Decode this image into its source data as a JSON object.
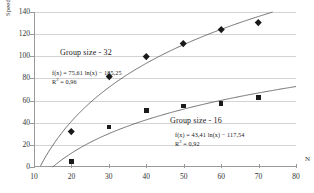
{
  "chart_data": {
    "type": "scatter",
    "title": "",
    "xlabel": "N",
    "ylabel": "Speed-up",
    "xlim": [
      10,
      80
    ],
    "ylim": [
      0,
      140
    ],
    "xticks": [
      10,
      20,
      30,
      40,
      50,
      60,
      70,
      80
    ],
    "yticks": [
      0,
      20,
      40,
      60,
      80,
      100,
      120,
      140
    ],
    "grid": "horizontal",
    "legend": "inline-annotations",
    "series": [
      {
        "name": "Group size - 32",
        "marker": "diamond",
        "x": [
          20,
          30,
          40,
          50,
          60,
          70
        ],
        "values": [
          32,
          82,
          100,
          112,
          124,
          131
        ],
        "trendline": {
          "kind": "logarithmic",
          "equation": "f(x) = 75,61 ln(x) − 185,25",
          "r_squared": "R² = 0,96",
          "a": 75.61,
          "b": -185.25
        }
      },
      {
        "name": "Group size - 16",
        "marker": "square",
        "x": [
          20,
          30,
          40,
          50,
          60,
          70
        ],
        "values": [
          5,
          36,
          51,
          55,
          57.5,
          63
        ],
        "trendline": {
          "kind": "logarithmic",
          "equation": "f(x) = 43,41 ln(x) − 117,54",
          "r_squared": "R² = 0,92",
          "a": 43.41,
          "b": -117.54
        }
      }
    ],
    "annotations": [
      {
        "id": "group32",
        "text": "Group size - 32"
      },
      {
        "id": "group32_eq",
        "text": "f(x) = 75,61 ln(x) − 185,25"
      },
      {
        "id": "group32_r2_prefix",
        "text": "R"
      },
      {
        "id": "group32_r2_suffix",
        "text": " = 0,96"
      },
      {
        "id": "group16",
        "text": "Group size - 16"
      },
      {
        "id": "group16_eq",
        "text": "f(x) = 43,41 ln(x) − 117,54"
      },
      {
        "id": "group16_r2_prefix",
        "text": "R"
      },
      {
        "id": "group16_r2_suffix",
        "text": " = 0,92"
      }
    ],
    "superscript": "2"
  },
  "colors": {
    "marker": "#1a1a1a",
    "trendline": "#4d4d4d",
    "gridline": "#d3d3d3",
    "axis": "#9a9a9a",
    "background": "#ffffff"
  }
}
